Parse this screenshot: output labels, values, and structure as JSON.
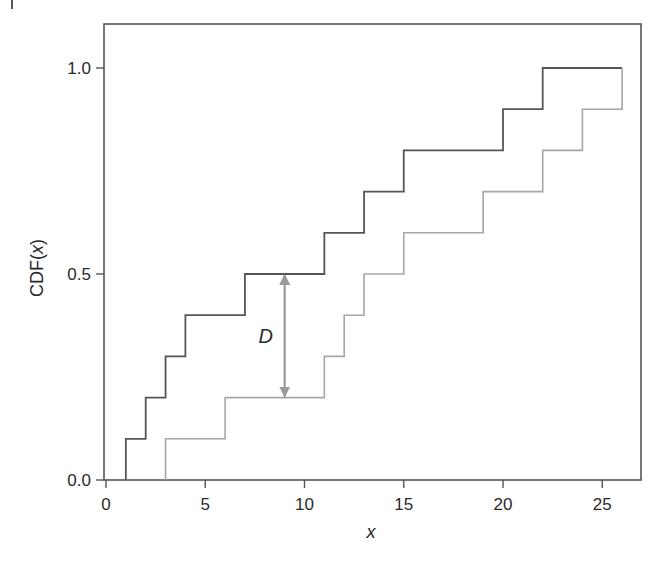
{
  "chart_data": {
    "type": "line",
    "subtype": "step (empirical CDF)",
    "title": "",
    "xlabel": "x",
    "ylabel": "CDF(x)",
    "xlim": [
      0,
      27
    ],
    "ylim": [
      0,
      1.1
    ],
    "xticks": [
      0,
      5,
      10,
      15,
      20,
      25
    ],
    "yticks": [
      0.0,
      0.5,
      1.0
    ],
    "xtick_labels": [
      "0",
      "5",
      "10",
      "15",
      "20",
      "25"
    ],
    "ytick_labels": [
      "0.0",
      "0.5",
      "1.0"
    ],
    "grid": false,
    "legend": null,
    "series": [
      {
        "name": "Sample 1 (dark)",
        "color": "#555555",
        "x": [
          1,
          2,
          3,
          4,
          7,
          11,
          13,
          15,
          20,
          22,
          26
        ],
        "values": [
          0.1,
          0.2,
          0.3,
          0.4,
          0.5,
          0.6,
          0.7,
          0.8,
          0.9,
          1.0,
          1.0
        ]
      },
      {
        "name": "Sample 2 (light)",
        "color": "#a6a6a6",
        "x": [
          3,
          6,
          11,
          12,
          13,
          15,
          19,
          22,
          24,
          26
        ],
        "values": [
          0.1,
          0.2,
          0.3,
          0.4,
          0.5,
          0.6,
          0.7,
          0.8,
          0.9,
          1.0
        ]
      }
    ],
    "annotations": [
      {
        "type": "double-arrow",
        "label": "D",
        "x": 9,
        "y_from": 0.2,
        "y_to": 0.5,
        "color": "#9a9a9a",
        "meaning": "Kolmogorov-Smirnov maximum distance between CDFs"
      }
    ]
  },
  "labels": {
    "xlabel": "x",
    "ylabel": "CDF(x)",
    "annotation": "D",
    "xticks": [
      "0",
      "5",
      "10",
      "15",
      "20",
      "25"
    ],
    "yticks": [
      "0.0",
      "0.5",
      "1.0"
    ]
  }
}
